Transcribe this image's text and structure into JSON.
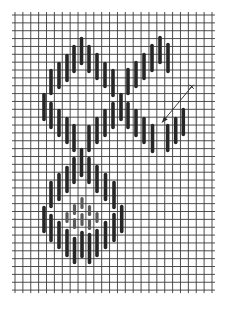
{
  "figure": {
    "title": ""
  },
  "colors": {
    "background": "#ffffff",
    "grid": "#3a3a3a",
    "stitch_dark": "#262626",
    "stitch_light": "#5a5a5a",
    "arrow": "#2a2a2a"
  },
  "grid": {
    "x0": 15,
    "y0": 15,
    "cols": 25,
    "rows": 35,
    "step_x": 7.88,
    "step_y": 7.86,
    "overhang": 3
  },
  "stitches": [
    {
      "x": 44,
      "y1": 93,
      "y2": 121,
      "tone": "dark"
    },
    {
      "x": 51,
      "y1": 69,
      "y2": 95,
      "tone": "dark"
    },
    {
      "x": 51,
      "y1": 102,
      "y2": 129,
      "tone": "dark"
    },
    {
      "x": 59,
      "y1": 62,
      "y2": 89,
      "tone": "dark"
    },
    {
      "x": 59,
      "y1": 109,
      "y2": 137,
      "tone": "dark"
    },
    {
      "x": 67,
      "y1": 54,
      "y2": 82,
      "tone": "dark"
    },
    {
      "x": 67,
      "y1": 117,
      "y2": 144,
      "tone": "dark"
    },
    {
      "x": 74,
      "y1": 45,
      "y2": 73,
      "tone": "dark"
    },
    {
      "x": 74,
      "y1": 124,
      "y2": 152,
      "tone": "dark"
    },
    {
      "x": 81.5,
      "y1": 37,
      "y2": 65,
      "tone": "dark"
    },
    {
      "x": 89,
      "y1": 45,
      "y2": 73,
      "tone": "dark"
    },
    {
      "x": 89,
      "y1": 125,
      "y2": 152,
      "tone": "dark"
    },
    {
      "x": 97,
      "y1": 53,
      "y2": 80,
      "tone": "dark"
    },
    {
      "x": 97,
      "y1": 117,
      "y2": 144,
      "tone": "dark"
    },
    {
      "x": 105,
      "y1": 62,
      "y2": 88,
      "tone": "dark"
    },
    {
      "x": 105,
      "y1": 109,
      "y2": 137,
      "tone": "dark"
    },
    {
      "x": 113,
      "y1": 69,
      "y2": 97,
      "tone": "dark"
    },
    {
      "x": 113,
      "y1": 102,
      "y2": 129,
      "tone": "dark"
    },
    {
      "x": 121,
      "y1": 93,
      "y2": 121,
      "tone": "dark"
    },
    {
      "x": 128,
      "y1": 68,
      "y2": 95,
      "tone": "dark"
    },
    {
      "x": 128,
      "y1": 102,
      "y2": 129,
      "tone": "dark"
    },
    {
      "x": 136,
      "y1": 61,
      "y2": 88,
      "tone": "dark"
    },
    {
      "x": 136,
      "y1": 109,
      "y2": 137,
      "tone": "dark"
    },
    {
      "x": 144,
      "y1": 53,
      "y2": 80,
      "tone": "dark"
    },
    {
      "x": 144,
      "y1": 117,
      "y2": 144,
      "tone": "dark"
    },
    {
      "x": 152,
      "y1": 44,
      "y2": 72,
      "tone": "dark"
    },
    {
      "x": 152.5,
      "y1": 124,
      "y2": 153,
      "tone": "dark"
    },
    {
      "x": 160,
      "y1": 36,
      "y2": 64,
      "tone": "dark"
    },
    {
      "x": 168,
      "y1": 43,
      "y2": 73,
      "tone": "dark"
    },
    {
      "x": 167.7,
      "y1": 124,
      "y2": 152,
      "tone": "dark"
    },
    {
      "x": 175.7,
      "y1": 117,
      "y2": 144,
      "tone": "dark"
    },
    {
      "x": 183.3,
      "y1": 108,
      "y2": 136,
      "tone": "dark"
    },
    {
      "x": 81.5,
      "y1": 148,
      "y2": 177,
      "tone": "dark"
    },
    {
      "x": 74,
      "y1": 157,
      "y2": 184,
      "tone": "dark"
    },
    {
      "x": 89,
      "y1": 157,
      "y2": 184,
      "tone": "dark"
    },
    {
      "x": 67,
      "y1": 166,
      "y2": 193,
      "tone": "dark"
    },
    {
      "x": 97,
      "y1": 165,
      "y2": 193,
      "tone": "dark"
    },
    {
      "x": 59,
      "y1": 173,
      "y2": 201,
      "tone": "dark"
    },
    {
      "x": 105.5,
      "y1": 173,
      "y2": 201,
      "tone": "dark"
    },
    {
      "x": 51,
      "y1": 181,
      "y2": 208,
      "tone": "dark"
    },
    {
      "x": 114,
      "y1": 181,
      "y2": 209,
      "tone": "dark"
    },
    {
      "x": 44,
      "y1": 206,
      "y2": 233,
      "tone": "dark"
    },
    {
      "x": 121.7,
      "y1": 205,
      "y2": 233,
      "tone": "dark"
    },
    {
      "x": 51,
      "y1": 214,
      "y2": 242,
      "tone": "dark"
    },
    {
      "x": 114,
      "y1": 213,
      "y2": 242,
      "tone": "dark"
    },
    {
      "x": 59,
      "y1": 221,
      "y2": 249,
      "tone": "dark"
    },
    {
      "x": 105.5,
      "y1": 221,
      "y2": 249,
      "tone": "dark"
    },
    {
      "x": 67,
      "y1": 229,
      "y2": 257,
      "tone": "dark"
    },
    {
      "x": 97,
      "y1": 229,
      "y2": 257,
      "tone": "dark"
    },
    {
      "x": 74.5,
      "y1": 237,
      "y2": 264,
      "tone": "dark"
    },
    {
      "x": 89.5,
      "y1": 233,
      "y2": 264,
      "tone": "dark"
    },
    {
      "x": 82,
      "y1": 231,
      "y2": 258,
      "tone": "dark"
    },
    {
      "x": 67,
      "y1": 212,
      "y2": 223,
      "tone": "light"
    },
    {
      "x": 97,
      "y1": 212,
      "y2": 223,
      "tone": "light"
    },
    {
      "x": 74.5,
      "y1": 204,
      "y2": 215,
      "tone": "light"
    },
    {
      "x": 74.5,
      "y1": 218,
      "y2": 229,
      "tone": "light"
    },
    {
      "x": 89.5,
      "y1": 205,
      "y2": 216,
      "tone": "light"
    },
    {
      "x": 89.5,
      "y1": 219,
      "y2": 230,
      "tone": "light"
    },
    {
      "x": 82,
      "y1": 197,
      "y2": 209,
      "tone": "light"
    },
    {
      "x": 82,
      "y1": 213,
      "y2": 226,
      "tone": "light"
    }
  ],
  "annotation": {
    "label": "x",
    "start": {
      "x": 191.7,
      "y": 86.7
    },
    "end": {
      "x": 162,
      "y": 122.5
    }
  }
}
